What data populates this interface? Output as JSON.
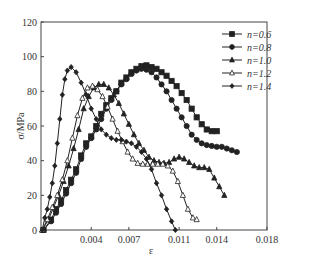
{
  "chart_data": {
    "type": "line",
    "title": "",
    "xlabel": "ε",
    "ylabel": "σ/MPa",
    "xlim": [
      0,
      0.018
    ],
    "ylim": [
      0,
      120
    ],
    "x_ticks": [
      "0.004",
      "0.007",
      "0.011",
      "0.014",
      "0.018"
    ],
    "x_tick_values": [
      0.004,
      0.007,
      0.011,
      0.014,
      0.018
    ],
    "y_ticks": [
      "0",
      "20",
      "40",
      "60",
      "80",
      "100",
      "120"
    ],
    "y_tick_values": [
      0,
      20,
      40,
      60,
      80,
      100,
      120
    ],
    "grid": false,
    "legend_position": "upper right",
    "series": [
      {
        "name": "n=0.6",
        "marker": "square-filled",
        "points": [
          [
            0.0002,
            0
          ],
          [
            0.0008,
            6
          ],
          [
            0.0012,
            12
          ],
          [
            0.0016,
            17
          ],
          [
            0.002,
            23
          ],
          [
            0.0024,
            29
          ],
          [
            0.0028,
            35
          ],
          [
            0.0032,
            43
          ],
          [
            0.0036,
            50
          ],
          [
            0.004,
            54
          ],
          [
            0.0044,
            60
          ],
          [
            0.0048,
            67
          ],
          [
            0.0052,
            72
          ],
          [
            0.0056,
            76
          ],
          [
            0.006,
            80
          ],
          [
            0.0064,
            85
          ],
          [
            0.0068,
            88
          ],
          [
            0.0072,
            91
          ],
          [
            0.0076,
            93
          ],
          [
            0.008,
            94.5
          ],
          [
            0.0084,
            95
          ],
          [
            0.0088,
            94
          ],
          [
            0.0092,
            93
          ],
          [
            0.0096,
            91
          ],
          [
            0.01,
            89
          ],
          [
            0.0104,
            86
          ],
          [
            0.0108,
            83
          ],
          [
            0.0112,
            79
          ],
          [
            0.0116,
            75
          ],
          [
            0.012,
            70
          ],
          [
            0.0124,
            65
          ],
          [
            0.0128,
            61
          ],
          [
            0.0132,
            58
          ],
          [
            0.0136,
            57
          ],
          [
            0.014,
            57
          ]
        ]
      },
      {
        "name": "n=0.8",
        "marker": "circle-filled",
        "points": [
          [
            0.0002,
            0
          ],
          [
            0.0008,
            5
          ],
          [
            0.0012,
            10
          ],
          [
            0.0016,
            15
          ],
          [
            0.002,
            21
          ],
          [
            0.0024,
            27
          ],
          [
            0.0028,
            33
          ],
          [
            0.0032,
            41
          ],
          [
            0.0036,
            48
          ],
          [
            0.004,
            53
          ],
          [
            0.0044,
            58
          ],
          [
            0.0048,
            64
          ],
          [
            0.0052,
            70
          ],
          [
            0.0056,
            75
          ],
          [
            0.006,
            80
          ],
          [
            0.0064,
            84
          ],
          [
            0.0068,
            87
          ],
          [
            0.0072,
            90
          ],
          [
            0.0076,
            92
          ],
          [
            0.008,
            93
          ],
          [
            0.0084,
            92.5
          ],
          [
            0.0088,
            91
          ],
          [
            0.0092,
            88
          ],
          [
            0.0096,
            84
          ],
          [
            0.01,
            80
          ],
          [
            0.0104,
            75
          ],
          [
            0.0108,
            70
          ],
          [
            0.0112,
            65
          ],
          [
            0.0116,
            60
          ],
          [
            0.012,
            55
          ],
          [
            0.0124,
            52
          ],
          [
            0.0128,
            50
          ],
          [
            0.0132,
            49
          ],
          [
            0.0136,
            48.5
          ],
          [
            0.014,
            48
          ],
          [
            0.0144,
            48
          ],
          [
            0.0148,
            47
          ],
          [
            0.0152,
            46
          ],
          [
            0.0156,
            45
          ]
        ]
      },
      {
        "name": "n=1.0",
        "marker": "triangle-filled",
        "points": [
          [
            0.0001,
            0
          ],
          [
            0.0006,
            6
          ],
          [
            0.001,
            13
          ],
          [
            0.0014,
            20
          ],
          [
            0.0018,
            28
          ],
          [
            0.0022,
            37
          ],
          [
            0.0026,
            47
          ],
          [
            0.003,
            58
          ],
          [
            0.0034,
            70
          ],
          [
            0.0038,
            77
          ],
          [
            0.0042,
            82
          ],
          [
            0.0046,
            84
          ],
          [
            0.005,
            84
          ],
          [
            0.0054,
            82
          ],
          [
            0.0058,
            78
          ],
          [
            0.0062,
            73
          ],
          [
            0.0066,
            67
          ],
          [
            0.007,
            61
          ],
          [
            0.0074,
            55
          ],
          [
            0.0078,
            50
          ],
          [
            0.0082,
            46
          ],
          [
            0.0086,
            42
          ],
          [
            0.009,
            40
          ],
          [
            0.0094,
            39
          ],
          [
            0.0098,
            38.5
          ],
          [
            0.0102,
            39
          ],
          [
            0.0106,
            41
          ],
          [
            0.011,
            42
          ],
          [
            0.0114,
            41
          ],
          [
            0.0118,
            39
          ],
          [
            0.0122,
            37
          ],
          [
            0.0126,
            36
          ],
          [
            0.013,
            36
          ],
          [
            0.0134,
            35
          ],
          [
            0.0138,
            30
          ],
          [
            0.0142,
            25
          ],
          [
            0.0146,
            20
          ]
        ]
      },
      {
        "name": "n=1.2",
        "marker": "triangle-open",
        "points": [
          [
            0.0001,
            0
          ],
          [
            0.0005,
            6
          ],
          [
            0.0009,
            13
          ],
          [
            0.0013,
            20
          ],
          [
            0.0017,
            29
          ],
          [
            0.0021,
            40
          ],
          [
            0.0025,
            53
          ],
          [
            0.0029,
            66
          ],
          [
            0.0033,
            76
          ],
          [
            0.0037,
            82
          ],
          [
            0.0041,
            83
          ],
          [
            0.0045,
            81
          ],
          [
            0.0049,
            77
          ],
          [
            0.0053,
            71
          ],
          [
            0.0057,
            64
          ],
          [
            0.0061,
            57
          ],
          [
            0.0065,
            51
          ],
          [
            0.0069,
            45
          ],
          [
            0.0073,
            41
          ],
          [
            0.0077,
            38.5
          ],
          [
            0.0081,
            38
          ],
          [
            0.0085,
            38
          ],
          [
            0.0089,
            38
          ],
          [
            0.0093,
            38
          ],
          [
            0.0097,
            38
          ],
          [
            0.0101,
            37
          ],
          [
            0.0105,
            34
          ],
          [
            0.0109,
            28
          ],
          [
            0.0113,
            20
          ],
          [
            0.0117,
            12
          ],
          [
            0.0121,
            7
          ],
          [
            0.0124,
            6
          ]
        ]
      },
      {
        "name": "n=1.4",
        "marker": "diamond-filled",
        "points": [
          [
            0.0001,
            0
          ],
          [
            0.0003,
            7
          ],
          [
            0.0005,
            12
          ],
          [
            0.0007,
            19
          ],
          [
            0.0009,
            27
          ],
          [
            0.0011,
            37
          ],
          [
            0.0013,
            50
          ],
          [
            0.0015,
            64
          ],
          [
            0.0017,
            78
          ],
          [
            0.0019,
            87
          ],
          [
            0.0021,
            92
          ],
          [
            0.0024,
            94
          ],
          [
            0.0028,
            91
          ],
          [
            0.0032,
            85
          ],
          [
            0.0036,
            78
          ],
          [
            0.004,
            70
          ],
          [
            0.0044,
            64
          ],
          [
            0.0048,
            58
          ],
          [
            0.0052,
            55
          ],
          [
            0.0056,
            53
          ],
          [
            0.006,
            52
          ],
          [
            0.0064,
            52
          ],
          [
            0.0068,
            51
          ],
          [
            0.0072,
            50
          ],
          [
            0.0076,
            48
          ],
          [
            0.008,
            45
          ],
          [
            0.0084,
            41
          ],
          [
            0.0088,
            35
          ],
          [
            0.0092,
            27
          ],
          [
            0.0096,
            20
          ],
          [
            0.01,
            12
          ],
          [
            0.0104,
            5
          ],
          [
            0.0107,
            0
          ]
        ]
      }
    ]
  },
  "legend": {
    "items": [
      {
        "label": "n=0.6",
        "marker": "square-filled"
      },
      {
        "label": "n=0.8",
        "marker": "circle-filled"
      },
      {
        "label": "n=1.0",
        "marker": "triangle-filled"
      },
      {
        "label": "n=1.2",
        "marker": "triangle-open"
      },
      {
        "label": "n=1.4",
        "marker": "diamond-filled"
      }
    ]
  },
  "axes": {
    "x_title": "ε",
    "y_title": "σ/MPa"
  },
  "colors": {
    "line": "#222222",
    "axis": "#444444",
    "background": "#ffffff"
  }
}
